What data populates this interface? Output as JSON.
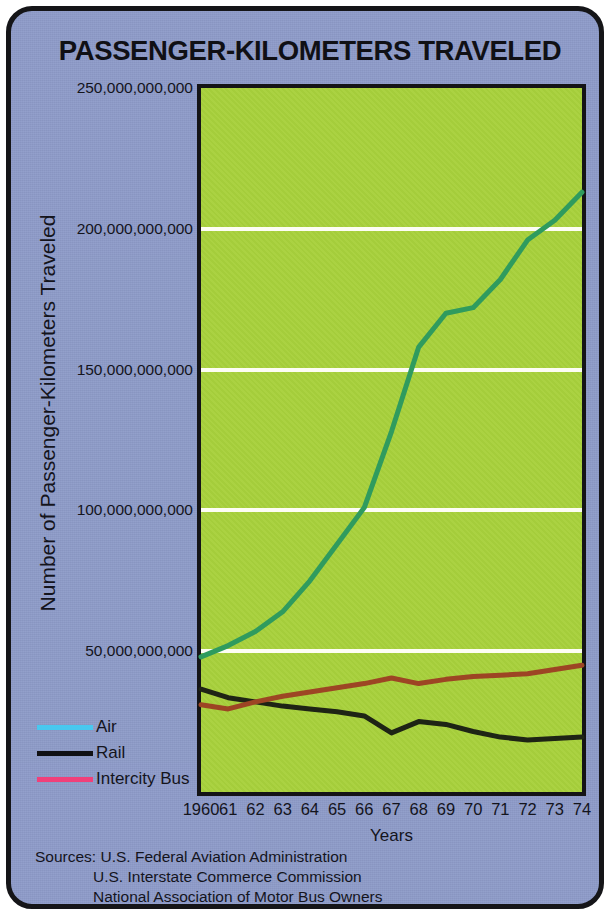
{
  "card": {
    "background_color": "#8e9cc9",
    "border_color": "#151518"
  },
  "chart_data": {
    "type": "line",
    "title": "PASSENGER-KILOMETERS TRAVELED",
    "xlabel": "Years",
    "ylabel": "Number of Passenger-Kilometers Traveled",
    "plot_background_color": "#a8d13c",
    "gridline_color": "#fdfdf4",
    "grid": true,
    "legend_position": "left-outside",
    "x": [
      1960,
      1961,
      1962,
      1963,
      1964,
      1965,
      1966,
      1967,
      1968,
      1969,
      1970,
      1971,
      1972,
      1973,
      1974
    ],
    "categories": [
      "1960",
      "61",
      "62",
      "63",
      "64",
      "65",
      "66",
      "67",
      "68",
      "69",
      "70",
      "71",
      "72",
      "73",
      "74"
    ],
    "xlim": [
      1960,
      1974
    ],
    "ylim": [
      0,
      250000000000
    ],
    "ytick_values": [
      50000000000,
      100000000000,
      150000000000,
      200000000000,
      250000000000
    ],
    "ytick_labels": [
      "50,000,000,000",
      "100,000,000,000",
      "150,000,000,000",
      "200,000,000,000",
      "250,000,000,000"
    ],
    "series": [
      {
        "name": "Air",
        "color": "#2f9b5e",
        "legend_swatch_color": "#49c8ef",
        "values": [
          48000000000,
          52000000000,
          57000000000,
          64000000000,
          75000000000,
          88000000000,
          101000000000,
          128000000000,
          158000000000,
          170000000000,
          172000000000,
          182000000000,
          196000000000,
          203000000000,
          213000000000
        ]
      },
      {
        "name": "Rail",
        "color": "#1e2415",
        "legend_swatch_color": "#111114",
        "values": [
          36500000000,
          33500000000,
          32000000000,
          30500000000,
          29500000000,
          28500000000,
          27000000000,
          21000000000,
          25000000000,
          24000000000,
          21500000000,
          19500000000,
          18500000000,
          19000000000,
          19500000000
        ]
      },
      {
        "name": "Intercity Bus",
        "color": "#9d4524",
        "legend_swatch_color": "#f0407a",
        "values": [
          31000000000,
          29500000000,
          32000000000,
          34000000000,
          35500000000,
          37000000000,
          38500000000,
          40500000000,
          38500000000,
          40000000000,
          41000000000,
          41500000000,
          42000000000,
          43500000000,
          45000000000
        ]
      }
    ]
  },
  "legend": {
    "items": [
      {
        "label": "Air"
      },
      {
        "label": "Rail"
      },
      {
        "label": "Intercity Bus"
      }
    ]
  },
  "sources": {
    "prefix": "Sources:",
    "lines": [
      "U.S. Federal Aviation Administration",
      "U.S. Interstate Commerce Commission",
      "National Association of Motor Bus Owners"
    ]
  }
}
